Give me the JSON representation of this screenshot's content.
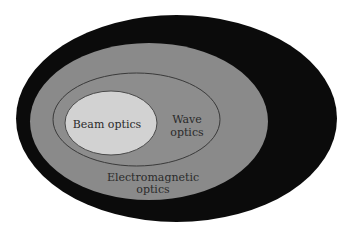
{
  "diagram": {
    "type": "nested-sets",
    "title": "",
    "colors": {
      "background": "#ffffff",
      "outer_ring": "#0b0b0b",
      "electromagnetic": "#8a8a8a",
      "wave": "#8d8d8d",
      "wave_outline": "#3a3a3a",
      "beam": "#d2d2d2",
      "text": "#2a2a2a"
    },
    "sets": [
      {
        "id": "outer",
        "label": ""
      },
      {
        "id": "electromagnetic",
        "label_line1": "Electromagnetic",
        "label_line2": "optics"
      },
      {
        "id": "wave",
        "label_line1": "Wave",
        "label_line2": "optics"
      },
      {
        "id": "beam",
        "label": "Beam optics"
      }
    ]
  }
}
